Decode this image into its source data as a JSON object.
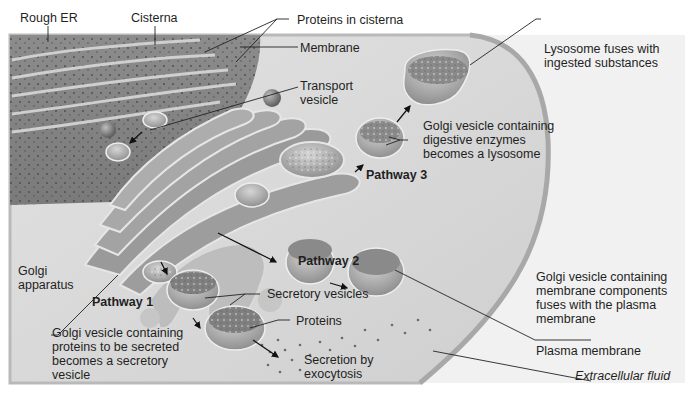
{
  "diagram": {
    "labels": {
      "rough_er": "Rough ER",
      "cisterna": "Cisterna",
      "proteins_in_cisterna": "Proteins in cisterna",
      "membrane": "Membrane",
      "transport_vesicle": "Transport\nvesicle",
      "lysosome_fuses": "Lysosome fuses with\ningested substances",
      "golgi_vesicle_digestive": "Golgi vesicle containing\ndigestive enzymes\nbecomes a lysosome",
      "pathway_3": "Pathway 3",
      "pathway_2": "Pathway 2",
      "pathway_1": "Pathway 1",
      "golgi_apparatus": "Golgi\napparatus",
      "secretory_vesicles": "Secretory vesicles",
      "proteins": "Proteins",
      "golgi_vesicle_secreted": "Golgi vesicle containing\nproteins to be secreted\nbecomes a secretory\nvesicle",
      "secretion_by_exocytosis": "Secretion by\nexocytosis",
      "golgi_vesicle_membrane": "Golgi vesicle containing\nmembrane components\nfuses with the plasma\nmembrane",
      "plasma_membrane": "Plasma membrane",
      "extracellular_fluid": "Extracellular fluid"
    },
    "pathways": [
      {
        "name": "Pathway 1",
        "description": "Golgi vesicle containing proteins to be secreted becomes a secretory vesicle; secretion by exocytosis"
      },
      {
        "name": "Pathway 2",
        "description": "Golgi vesicle containing membrane components fuses with the plasma membrane"
      },
      {
        "name": "Pathway 3",
        "description": "Golgi vesicle containing digestive enzymes becomes a lysosome; lysosome fuses with ingested substances"
      }
    ],
    "colors": {
      "cytoplasm": "#dcdcdc",
      "organelle": "#8f8f8f",
      "organelle_dark": "#6e6e6e",
      "highlight": "#e8e8e8",
      "extracellular": "#f2f2f2",
      "leader_line": "#222222"
    }
  }
}
